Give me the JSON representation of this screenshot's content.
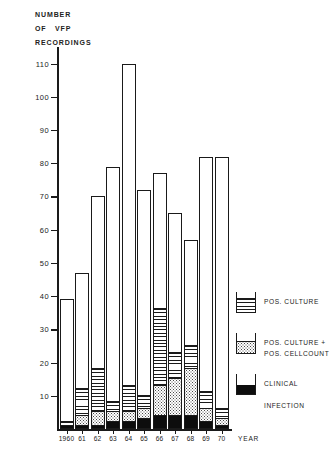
{
  "title_lines": [
    "NUMBER",
    "OF   VFP",
    "RECORDINGS"
  ],
  "axis": {
    "x_caption": "YEAR",
    "y_ticks": [
      10,
      20,
      30,
      40,
      50,
      60,
      70,
      80,
      90,
      100,
      110
    ]
  },
  "legend": {
    "items": [
      {
        "key": "culture",
        "label": "POS. CULTURE"
      },
      {
        "key": "culture_cell",
        "label": "POS. CULTURE +\nPOS. CELLCOUNT"
      },
      {
        "key": "clinical",
        "label": "CLINICAL\n\nINFECTION"
      }
    ]
  },
  "colors": {
    "ink": "#1a1a1a",
    "paper": "#ffffff",
    "clinical": "#0d0d0d",
    "cellcount": "#4a4a4a"
  },
  "chart_data": {
    "type": "bar",
    "title": "NUMBER OF VFP RECORDINGS",
    "xlabel": "YEAR",
    "ylabel": "NUMBER OF VFP RECORDINGS",
    "ylim": [
      0,
      115
    ],
    "grid": false,
    "legend_position": "right",
    "stacked": true,
    "categories": [
      "1960",
      "61",
      "62",
      "63",
      "64",
      "65",
      "66",
      "67",
      "68",
      "69",
      "70"
    ],
    "values": [
      39,
      47,
      70,
      79,
      110,
      72,
      77,
      65,
      57,
      82,
      82
    ],
    "series": [
      {
        "name": "POS. CULTURE",
        "values": [
          1,
          8,
          13,
          3,
          8,
          4,
          23,
          8,
          7,
          5,
          3
        ]
      },
      {
        "name": "POS. CULTURE + POS. CELLCOUNT",
        "values": [
          0,
          3,
          4,
          3,
          3,
          3,
          9,
          11,
          14,
          4,
          2
        ]
      },
      {
        "name": "CLINICAL INFECTION",
        "values": [
          1,
          1,
          1,
          2,
          2,
          3,
          4,
          4,
          4,
          2,
          1
        ]
      }
    ]
  }
}
